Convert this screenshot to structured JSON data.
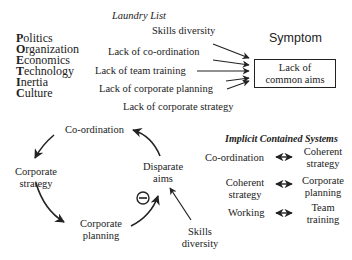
{
  "poetic": {
    "items": [
      {
        "initial": "P",
        "rest": "olitics"
      },
      {
        "initial": "O",
        "rest": "rganization"
      },
      {
        "initial": "E",
        "rest": "conomics"
      },
      {
        "initial": "T",
        "rest": "echnology"
      },
      {
        "initial": "I",
        "rest": "nertia"
      },
      {
        "initial": "C",
        "rest": "ulture"
      }
    ]
  },
  "laundry": {
    "title": "Laundry List",
    "items": [
      "Skills diversity",
      "Lack of co-ordination",
      "Lack of team training",
      "Lack of corporate planning",
      "Lack of corporate strategy"
    ]
  },
  "symptom": {
    "title": "Symptom",
    "box_line1": "Lack of",
    "box_line2": "common aims"
  },
  "cycle": {
    "nodes": {
      "coordination": "Co-ordination",
      "strategy_1": "Corporate",
      "strategy_2": "strategy",
      "planning_1": "Corporate",
      "planning_2": "planning",
      "disparate_1": "Disparate",
      "disparate_2": "aims"
    },
    "minus_symbol": "−",
    "external_1": "Skills",
    "external_2": "diversity"
  },
  "implicit": {
    "title": "Implicit Contained Systems",
    "rows": [
      {
        "left": [
          "Co-ordination"
        ],
        "right": [
          "Coherent",
          "strategy"
        ]
      },
      {
        "left": [
          "Coherent",
          "strategy"
        ],
        "right": [
          "Corporate",
          "planning"
        ]
      },
      {
        "left": [
          "Working"
        ],
        "right": [
          "Team",
          "training"
        ]
      }
    ]
  }
}
